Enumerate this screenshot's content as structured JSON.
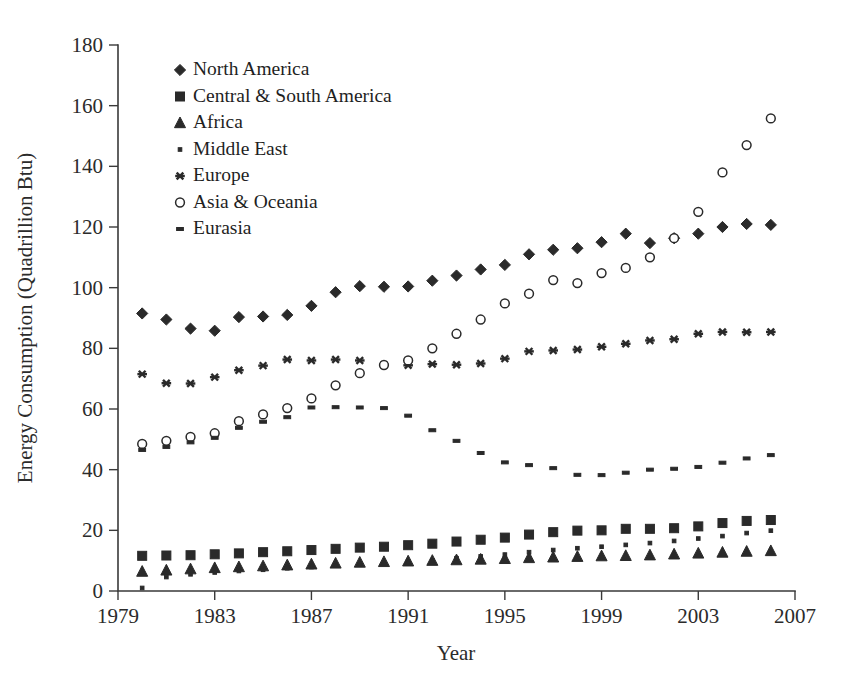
{
  "chart_data": {
    "type": "scatter",
    "title": "",
    "xlabel": "Year",
    "ylabel": "Energy Consumption (Quadrillion Btu)",
    "xlim": [
      1979,
      2007
    ],
    "ylim": [
      0,
      180
    ],
    "x_ticks": [
      1979,
      1983,
      1987,
      1991,
      1995,
      1999,
      2003,
      2007
    ],
    "y_ticks": [
      0,
      20,
      40,
      60,
      80,
      100,
      120,
      140,
      160,
      180
    ],
    "grid": false,
    "legend_position": "top-left",
    "x": [
      1980,
      1981,
      1982,
      1983,
      1984,
      1985,
      1986,
      1987,
      1988,
      1989,
      1990,
      1991,
      1992,
      1993,
      1994,
      1995,
      1996,
      1997,
      1998,
      1999,
      2000,
      2001,
      2002,
      2003,
      2004,
      2005,
      2006
    ],
    "series": [
      {
        "name": "North America",
        "marker": "filled-diamond",
        "values": [
          91.5,
          89.5,
          86.5,
          85.8,
          90.3,
          90.5,
          91.0,
          94.0,
          98.5,
          100.5,
          100.3,
          100.4,
          102.3,
          104.0,
          106.0,
          107.5,
          111.0,
          112.5,
          113.0,
          115.0,
          117.8,
          114.7,
          116.3,
          117.8,
          120.0,
          121.0,
          120.7
        ]
      },
      {
        "name": "Central & South America",
        "marker": "filled-square",
        "values": [
          11.6,
          11.7,
          11.8,
          12.1,
          12.4,
          12.8,
          13.1,
          13.5,
          13.9,
          14.3,
          14.6,
          15.1,
          15.6,
          16.3,
          16.9,
          17.6,
          18.6,
          19.4,
          19.9,
          20.0,
          20.5,
          20.5,
          20.7,
          21.3,
          22.4,
          23.1,
          23.4
        ]
      },
      {
        "name": "Africa",
        "marker": "filled-triangle",
        "values": [
          6.4,
          6.8,
          7.2,
          7.6,
          7.9,
          8.2,
          8.5,
          8.8,
          9.1,
          9.4,
          9.6,
          9.8,
          10.0,
          10.2,
          10.4,
          10.6,
          10.9,
          11.1,
          11.3,
          11.5,
          11.6,
          11.8,
          12.1,
          12.4,
          12.7,
          13.0,
          13.2
        ]
      },
      {
        "name": "Middle East",
        "marker": "small-dot",
        "values": [
          1.0,
          4.6,
          5.5,
          6.1,
          6.6,
          7.0,
          7.5,
          7.9,
          8.4,
          8.8,
          9.2,
          9.6,
          10.1,
          10.8,
          11.4,
          12.0,
          12.8,
          13.5,
          14.1,
          14.6,
          15.2,
          15.8,
          16.5,
          17.3,
          18.1,
          19.1,
          19.9
        ]
      },
      {
        "name": "Europe",
        "marker": "asterisk",
        "values": [
          71.5,
          68.5,
          68.4,
          70.5,
          72.8,
          74.3,
          76.3,
          76.0,
          76.3,
          76.0,
          74.6,
          74.4,
          74.8,
          74.6,
          75.0,
          76.6,
          79.0,
          79.3,
          79.6,
          80.5,
          81.5,
          82.6,
          83.0,
          84.8,
          85.4,
          85.3,
          85.4
        ]
      },
      {
        "name": "Asia & Oceania",
        "marker": "open-circle",
        "values": [
          48.5,
          49.5,
          50.8,
          52.0,
          56.0,
          58.2,
          60.3,
          63.5,
          67.8,
          71.8,
          74.5,
          76.0,
          80.0,
          84.8,
          89.5,
          94.8,
          98.0,
          102.5,
          101.5,
          104.8,
          106.5,
          110.0,
          116.3,
          125.0,
          138.0,
          147.0,
          155.8
        ]
      },
      {
        "name": "Eurasia",
        "marker": "dash",
        "values": [
          46.5,
          47.5,
          49.0,
          50.5,
          53.8,
          55.8,
          57.3,
          60.5,
          60.6,
          60.5,
          60.3,
          57.8,
          53.0,
          49.5,
          45.5,
          42.4,
          41.5,
          40.5,
          38.3,
          38.2,
          39.0,
          40.0,
          40.3,
          40.9,
          42.3,
          43.7,
          44.8
        ]
      }
    ],
    "legend": [
      {
        "label": "North America",
        "marker": "filled-diamond"
      },
      {
        "label": "Central & South America",
        "marker": "filled-square"
      },
      {
        "label": "Africa",
        "marker": "filled-triangle"
      },
      {
        "label": "Middle East",
        "marker": "small-dot"
      },
      {
        "label": "Europe",
        "marker": "asterisk"
      },
      {
        "label": "Asia & Oceania",
        "marker": "open-circle"
      },
      {
        "label": "Eurasia",
        "marker": "dash"
      }
    ]
  },
  "colors": {
    "ink": "#2a2a2a",
    "axis": "#3a3a3a",
    "background": "#ffffff"
  }
}
